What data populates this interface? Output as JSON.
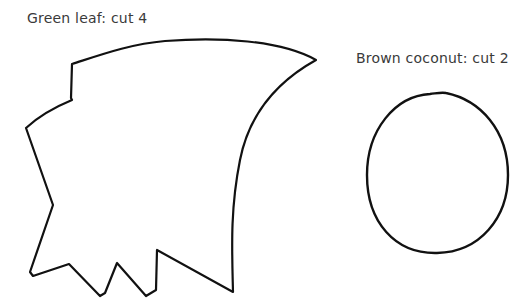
{
  "template": {
    "pieces": [
      {
        "name": "leaf",
        "label": "Green leaf: cut 4",
        "shape": "jagged-leaf-outline"
      },
      {
        "name": "coconut",
        "label": "Brown coconut: cut 2",
        "shape": "oval-outline"
      }
    ]
  },
  "colors": {
    "background": "#ffffff",
    "outline": "#111111",
    "text": "#3a3a3a"
  }
}
